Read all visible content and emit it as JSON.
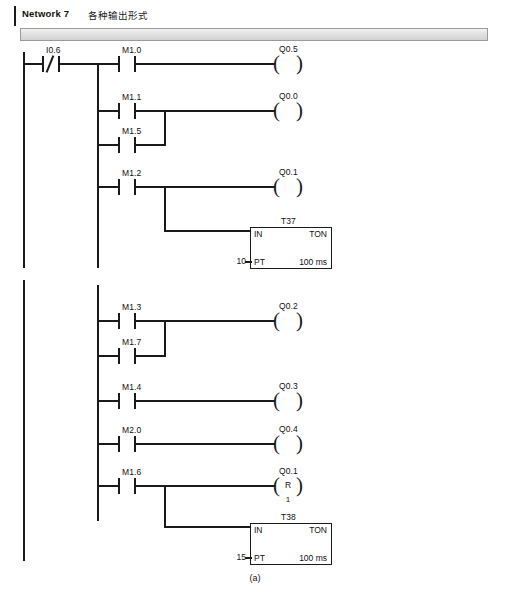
{
  "page": {
    "caption": "(a)",
    "width": 510,
    "height": 595,
    "line_color": "#1a1a1a"
  },
  "network": {
    "title": "Network 7",
    "comment": "各种输出形式"
  },
  "labels": {
    "timer_in": "IN",
    "timer_type": "TON",
    "timer_pt": "PT",
    "timer_base": "100 ms",
    "reset_letter": "R",
    "reset_count": "1"
  },
  "rungs": [
    {
      "id": "rung-1",
      "contacts": [
        {
          "name": "I0.6",
          "type": "normally-closed"
        },
        {
          "name": "M1.0",
          "type": "normally-open"
        }
      ],
      "coil": "Q0.5",
      "coil_type": "output"
    },
    {
      "id": "rung-2",
      "contacts": [
        {
          "name": "M1.1",
          "type": "normally-open"
        },
        {
          "name": "M1.5",
          "type": "normally-open"
        }
      ],
      "coil": "Q0.0",
      "coil_type": "output",
      "parallel": true
    },
    {
      "id": "rung-3",
      "contacts": [
        {
          "name": "M1.2",
          "type": "normally-open"
        }
      ],
      "coil": "Q0.1",
      "coil_type": "output",
      "timer": {
        "name": "T37",
        "preset": "10",
        "type": "TON",
        "base": "100 ms"
      }
    },
    {
      "id": "rung-4",
      "contacts": [
        {
          "name": "M1.3",
          "type": "normally-open"
        },
        {
          "name": "M1.7",
          "type": "normally-open"
        }
      ],
      "coil": "Q0.2",
      "coil_type": "output",
      "parallel": true
    },
    {
      "id": "rung-5",
      "contacts": [
        {
          "name": "M1.4",
          "type": "normally-open"
        }
      ],
      "coil": "Q0.3",
      "coil_type": "output"
    },
    {
      "id": "rung-6",
      "contacts": [
        {
          "name": "M2.0",
          "type": "normally-open"
        }
      ],
      "coil": "Q0.4",
      "coil_type": "output"
    },
    {
      "id": "rung-7",
      "contacts": [
        {
          "name": "M1.6",
          "type": "normally-open"
        }
      ],
      "coil": "Q0.1",
      "coil_type": "reset",
      "reset_value": "1",
      "timer": {
        "name": "T38",
        "preset": "15",
        "type": "TON",
        "base": "100 ms"
      }
    }
  ]
}
